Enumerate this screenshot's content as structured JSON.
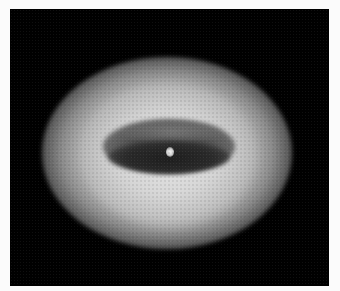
{
  "image": {
    "description": "Grayscale image of a bright diffuse elliptical glow with a darker elliptical core on a black background",
    "colors": {
      "page_background": "#fbfbfb",
      "frame_background": "#000000",
      "glow_peak": "#d8d8d8",
      "core_dark": "#2a2a2a",
      "bright_spot": "#f4f4f4"
    }
  }
}
